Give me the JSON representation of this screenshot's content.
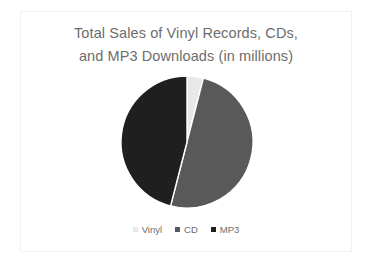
{
  "chart_data": {
    "type": "pie",
    "title": "Total Sales of Vinyl Records, CDs, and MP3 Downloads (in millions)",
    "title_lines": [
      "Total Sales of Vinyl Records, CDs,",
      "and MP3 Downloads (in millions)"
    ],
    "categories": [
      "Vinyl",
      "CD",
      "MP3"
    ],
    "values": [
      4,
      50,
      46
    ],
    "unit": "millions",
    "legend_position": "bottom",
    "grid": false,
    "slice_colors": [
      "#e8e8e8",
      "#595959",
      "#1f1f1f"
    ],
    "slices": [
      {
        "label": "Vinyl",
        "value": 4,
        "percent": 4,
        "color": "#e8e8e8",
        "start_angle": 0,
        "end_angle": 14.4
      },
      {
        "label": "CD",
        "value": 50,
        "percent": 50,
        "color": "#595959",
        "start_angle": 14.4,
        "end_angle": 194.4
      },
      {
        "label": "MP3",
        "value": 46,
        "percent": 46,
        "color": "#1f1f1f",
        "start_angle": 194.4,
        "end_angle": 360
      }
    ]
  },
  "legend": {
    "items": [
      {
        "label": "Vinyl",
        "color": "#e8e8e8",
        "marker": "square-marker"
      },
      {
        "label": "CD",
        "color": "#595959",
        "marker": "square-marker"
      },
      {
        "label": "MP3",
        "color": "#1f1f1f",
        "marker": "square-marker"
      }
    ]
  },
  "style": {
    "title_color": "#6d6d6d",
    "legend_text_color": "#6d6d6d",
    "frame_border_color": "#f2f2f2",
    "background": "#ffffff"
  },
  "geometry": {
    "center_x": 166,
    "center_y": 72,
    "radius": 66
  }
}
